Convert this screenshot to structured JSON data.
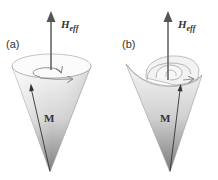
{
  "figure": {
    "panels": [
      {
        "id": "a",
        "label": "(a)",
        "field_label": "H",
        "field_subscript": "eff",
        "vector_label": "M",
        "description": "undamped precession: magnetization M precesses on a cone around H_eff"
      },
      {
        "id": "b",
        "label": "(b)",
        "field_label": "H",
        "field_subscript": "eff",
        "vector_label": "M",
        "description": "damped precession: magnetization M spirals toward H_eff"
      }
    ],
    "colors": {
      "arrow": "#555555",
      "cone_light": "#f4f4f4",
      "cone_dark": "#8a8a8a",
      "outline": "#888888",
      "text": "#333333"
    }
  }
}
